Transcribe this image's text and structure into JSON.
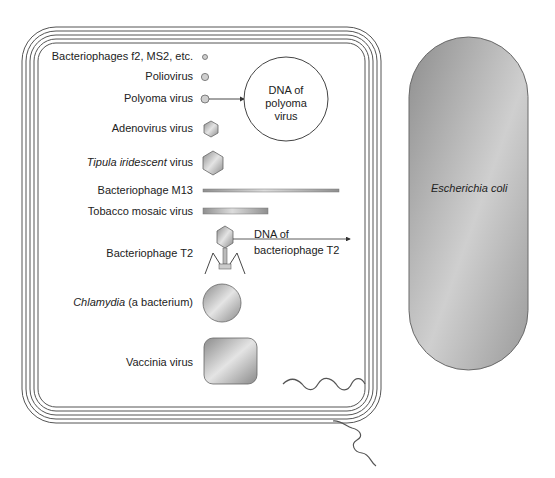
{
  "figure": {
    "type": "size-comparison diagram",
    "container": {
      "name": "Escherichia coli cell envelope (magnified section)",
      "frame_line_count": 5
    },
    "items": [
      {
        "id": "f2",
        "label": "Bacteriophages f2, MS2, etc.",
        "label_italic": "",
        "label_rest": "Bacteriophages f2, MS2, etc.",
        "shape": "tiny-circle"
      },
      {
        "id": "polio",
        "label": "Poliovirus",
        "label_italic": "",
        "label_rest": "Poliovirus",
        "shape": "small-circle"
      },
      {
        "id": "polyoma",
        "label": "Polyoma virus",
        "label_italic": "",
        "label_rest": "Polyoma virus",
        "shape": "small-circle-with-arrow"
      },
      {
        "id": "adeno",
        "label": "Adenovirus virus",
        "label_italic": "",
        "label_rest": "Adenovirus virus",
        "shape": "hexagon-small"
      },
      {
        "id": "tipula",
        "label": "Tipula iridescent virus",
        "label_italic": "Tipula iridescent",
        "label_rest": " virus",
        "shape": "hexagon-large"
      },
      {
        "id": "m13",
        "label": "Bacteriophage M13",
        "label_italic": "",
        "label_rest": "Bacteriophage M13",
        "shape": "long-thin-rod"
      },
      {
        "id": "tmv",
        "label": "Tobacco mosaic virus",
        "label_italic": "",
        "label_rest": "Tobacco mosaic virus",
        "shape": "short-rod"
      },
      {
        "id": "t2",
        "label": "Bacteriophage T2",
        "label_italic": "",
        "label_rest": "Bacteriophage T2",
        "shape": "phage-with-tail"
      },
      {
        "id": "chlamydia",
        "label": "Chlamydia (a bacterium)",
        "label_italic": "Chlamydia",
        "label_rest": " (a bacterium)",
        "shape": "sphere"
      },
      {
        "id": "vaccinia",
        "label": "Vaccinia virus",
        "label_italic": "",
        "label_rest": "Vaccinia virus",
        "shape": "rounded-square"
      }
    ],
    "annotations": {
      "polyoma_dna": {
        "line1": "DNA of",
        "line2": "polyoma",
        "line3": "virus"
      },
      "t2_dna": {
        "line1": "DNA of",
        "line2": "bacteriophage T2"
      }
    },
    "ecoli": {
      "label": "Escherichia coli",
      "shape": "capsule"
    },
    "colors": {
      "line": "#555555",
      "fill_dark": "#8a8a8a",
      "fill_light": "#e2e2e2",
      "text": "#222222"
    }
  }
}
